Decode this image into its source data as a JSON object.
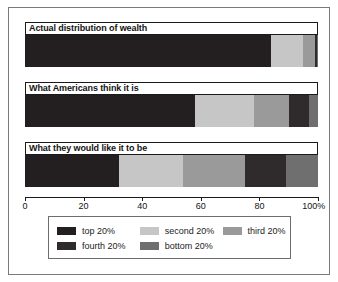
{
  "chart_data": {
    "type": "bar",
    "orientation": "horizontal",
    "stacked": true,
    "title": "",
    "xlabel": "",
    "ylabel": "",
    "xlim": [
      0,
      100
    ],
    "grid": false,
    "legend_position": "bottom",
    "categories": [
      "Actual distribution of wealth",
      "What Americans think it is",
      "What they would like it to be"
    ],
    "series": [
      {
        "name": "top 20%",
        "color": "#231f20",
        "values": [
          84,
          58,
          32
        ]
      },
      {
        "name": "second 20%",
        "color": "#c6c6c6",
        "values": [
          11,
          20,
          22
        ]
      },
      {
        "name": "third 20%",
        "color": "#9a9a9a",
        "values": [
          4,
          12,
          21
        ]
      },
      {
        "name": "fourth 20%",
        "color": "#2f2b2c",
        "values": [
          0.7,
          7,
          14
        ]
      },
      {
        "name": "bottom 20%",
        "color": "#6f6f6f",
        "values": [
          0.3,
          3,
          11
        ]
      }
    ],
    "xticks": [
      0,
      20,
      40,
      60,
      80,
      100
    ],
    "xticklabels": [
      "0",
      "20",
      "40",
      "60",
      "80",
      "100%"
    ]
  },
  "legend": {
    "entries": [
      {
        "label": "top 20%"
      },
      {
        "label": "second 20%"
      },
      {
        "label": "third 20%"
      },
      {
        "label": "fourth 20%"
      },
      {
        "label": "bottom 20%"
      }
    ]
  }
}
